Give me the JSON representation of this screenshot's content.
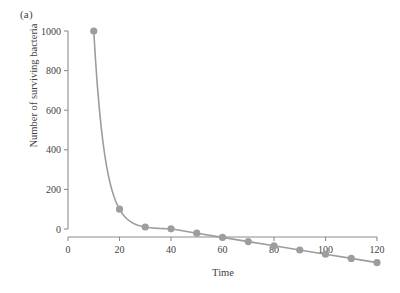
{
  "figure": {
    "panel_label": "(a)",
    "colors": {
      "marker": "#9d9d9d",
      "line": "#9d9d9d",
      "axis": "#8c8c8c",
      "text": "#3f3f3f",
      "background": "#ffffff"
    }
  },
  "chart_data": {
    "type": "line",
    "title": "",
    "subtitle": "",
    "panel_label": "(a)",
    "xlabel": "Time",
    "ylabel": "Number of surviving bacteria",
    "xlim": [
      0,
      120
    ],
    "ylim": [
      0,
      1000
    ],
    "xticks": [
      0,
      20,
      40,
      60,
      80,
      100,
      120
    ],
    "yticks": [
      0,
      200,
      400,
      600,
      800,
      1000
    ],
    "xtick_labels": [
      "0",
      "20",
      "40",
      "60",
      "80",
      "100",
      "120"
    ],
    "ytick_labels": [
      "0",
      "200",
      "400",
      "600",
      "800",
      "1000"
    ],
    "grid": false,
    "legend": false,
    "legend_position": "none",
    "markers": "filled-circle",
    "x": [
      10,
      20,
      30,
      40,
      50,
      60,
      70,
      80,
      90,
      100,
      110,
      120
    ],
    "values": [
      1000,
      100,
      10,
      1,
      0,
      0,
      0,
      0,
      0,
      0,
      0,
      0
    ],
    "series": [
      {
        "name": "surviving bacteria",
        "x": [
          10,
          20,
          30,
          40,
          50,
          60,
          70,
          80,
          90,
          100,
          110,
          120
        ],
        "values": [
          1000,
          100,
          10,
          1,
          0,
          0,
          0,
          0,
          0,
          0,
          0,
          0
        ]
      }
    ],
    "annotations": []
  }
}
